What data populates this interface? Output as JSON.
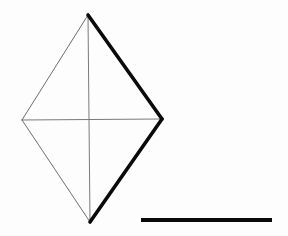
{
  "figure": {
    "media": "scanned line drawing on paper",
    "canvas": {
      "width": 288,
      "height": 236,
      "background_color": "#fdfdfd"
    },
    "colors": {
      "paper": "#fdfdfd",
      "heavy_stroke": "#0a0a0a",
      "light_stroke": "#6e6e72",
      "scale_bar": "#090909",
      "ghost_text": "#e9e9ec"
    },
    "shape": {
      "name": "rhombus",
      "description": "Four-sided diamond outline with both diagonals drawn",
      "vertices": [
        {
          "name": "top-apex",
          "x": 88,
          "y": 15
        },
        {
          "name": "right-vertex",
          "x": 162,
          "y": 119
        },
        {
          "name": "bottom-apex",
          "x": 90,
          "y": 222
        },
        {
          "name": "left-vertex",
          "x": 22,
          "y": 120
        }
      ],
      "center": {
        "x": 89,
        "y": 119
      },
      "edges": [
        {
          "name": "upper-left-edge",
          "from": "top-apex",
          "to": "left-vertex",
          "weight": "thin",
          "stroke_width": 1.0,
          "color": "#6e6e72"
        },
        {
          "name": "upper-right-edge",
          "from": "top-apex",
          "to": "right-vertex",
          "weight": "heavy",
          "stroke_width": 3.6,
          "color": "#0a0a0a"
        },
        {
          "name": "lower-right-edge",
          "from": "right-vertex",
          "to": "bottom-apex",
          "weight": "heavy",
          "stroke_width": 3.6,
          "color": "#0a0a0a"
        },
        {
          "name": "lower-left-edge",
          "from": "bottom-apex",
          "to": "left-vertex",
          "weight": "thin",
          "stroke_width": 1.0,
          "color": "#6e6e72"
        }
      ],
      "diagonals": [
        {
          "name": "vertical-diagonal",
          "from": "top-apex",
          "to": "bottom-apex",
          "weight": "thin",
          "stroke_width": 1.0,
          "color": "#7a7a7e"
        },
        {
          "name": "horizontal-diagonal",
          "from": "left-vertex",
          "to": "right-vertex",
          "weight": "thin",
          "stroke_width": 1.0,
          "color": "#7a7a7e"
        }
      ]
    },
    "scale_bar": {
      "name": "scale-bar",
      "x1": 141,
      "y1": 220,
      "x2": 272,
      "y2": 220,
      "thickness": 4,
      "length_px": 131,
      "color": "#090909",
      "label": ""
    },
    "ghost_marks": {
      "description": "Faint illegible bleed-through from the reverse of the page; no readable characters",
      "legible_text": "",
      "blots": [
        {
          "x": 6,
          "y": 46,
          "w": 52,
          "h": 13,
          "opacity": 0.55
        },
        {
          "x": 10,
          "y": 62,
          "w": 40,
          "h": 10,
          "opacity": 0.4
        },
        {
          "x": 34,
          "y": 76,
          "w": 46,
          "h": 18,
          "opacity": 0.45
        },
        {
          "x": 40,
          "y": 100,
          "w": 44,
          "h": 14,
          "opacity": 0.35
        },
        {
          "x": 46,
          "y": 132,
          "w": 38,
          "h": 22,
          "opacity": 0.38
        },
        {
          "x": 30,
          "y": 162,
          "w": 50,
          "h": 16,
          "opacity": 0.3
        },
        {
          "x": 178,
          "y": 78,
          "w": 62,
          "h": 12,
          "opacity": 0.5
        },
        {
          "x": 184,
          "y": 92,
          "w": 72,
          "h": 11,
          "opacity": 0.45
        },
        {
          "x": 182,
          "y": 104,
          "w": 68,
          "h": 12,
          "opacity": 0.48
        },
        {
          "x": 186,
          "y": 118,
          "w": 58,
          "h": 10,
          "opacity": 0.42
        },
        {
          "x": 180,
          "y": 130,
          "w": 66,
          "h": 11,
          "opacity": 0.4
        },
        {
          "x": 188,
          "y": 144,
          "w": 54,
          "h": 10,
          "opacity": 0.36
        },
        {
          "x": 192,
          "y": 158,
          "w": 48,
          "h": 12,
          "opacity": 0.34
        },
        {
          "x": 196,
          "y": 172,
          "w": 40,
          "h": 9,
          "opacity": 0.3
        },
        {
          "x": 150,
          "y": 206,
          "w": 58,
          "h": 8,
          "opacity": 0.26
        },
        {
          "x": 226,
          "y": 204,
          "w": 40,
          "h": 8,
          "opacity": 0.24
        }
      ]
    }
  }
}
